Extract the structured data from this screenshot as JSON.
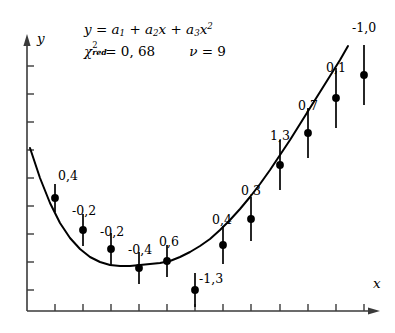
{
  "figure": {
    "title_equation": "y = a1 + a2x + a3x2",
    "axis_x_label": "x",
    "axis_y_label": "y",
    "equation": {
      "lhs": "y",
      "eq_sign": "=",
      "term1_coef": "a",
      "term1_sub": "1",
      "plus1": "+",
      "term2_coef": "a",
      "term2_sub": "2",
      "term2_var": "x",
      "plus2": "+",
      "term3_coef": "a",
      "term3_sub": "3",
      "term3_var": "x",
      "term3_pow": "2"
    },
    "stats": {
      "chi_symbol": "χ",
      "chi_sup": "2",
      "chi_sub": "red",
      "chi_eq": "=",
      "chi_value": "0, 68",
      "nu_symbol": "ν",
      "nu_eq": "=",
      "nu_value": "9"
    },
    "colors": {
      "line": "#000000",
      "marker": "#000000",
      "axis": "#3a3a3a",
      "background": "#ffffff"
    }
  },
  "chart_data": {
    "type": "scatter",
    "xlabel": "x",
    "ylabel": "y",
    "grid": false,
    "legend": null,
    "annotations": [
      "y = a_1 + a_2 x + a_3 x^2",
      "chi^2_red = 0,68",
      "nu = 9"
    ],
    "fit": {
      "model": "quadratic",
      "chi2_red": 0.68,
      "dof": 9,
      "description": "least-squares parabola through data points"
    },
    "point_labels": [
      "0,4",
      "-0,2",
      "-0,2",
      "-0,4",
      "0,6",
      "-1,3",
      "0,4",
      "0,3",
      "1,3",
      "0,7",
      "0,1",
      "-1,0"
    ],
    "points": [
      {
        "label": "0,4",
        "px": 55,
        "py": 198,
        "err_px": 14,
        "label_px": 58,
        "label_py": 170
      },
      {
        "label": "-0,2",
        "px": 83,
        "py": 230,
        "err_px": 16,
        "label_px": 72,
        "label_py": 205
      },
      {
        "label": "-0,2",
        "px": 111,
        "py": 249,
        "err_px": 16,
        "label_px": 100,
        "label_py": 226
      },
      {
        "label": "-0,4",
        "px": 139,
        "py": 268,
        "err_px": 16,
        "label_px": 128,
        "label_py": 244
      },
      {
        "label": "0,6",
        "px": 167,
        "py": 261,
        "err_px": 16,
        "label_px": 159,
        "label_py": 236
      },
      {
        "label": "-1,3",
        "px": 195,
        "py": 290,
        "err_px": 17,
        "label_px": 199,
        "label_py": 273
      },
      {
        "label": "0,4",
        "px": 223,
        "py": 245,
        "err_px": 19,
        "label_px": 212,
        "label_py": 214
      },
      {
        "label": "0,3",
        "px": 251,
        "py": 219,
        "err_px": 22,
        "label_px": 241,
        "label_py": 185
      },
      {
        "label": "1,3",
        "px": 280,
        "py": 165,
        "err_px": 25,
        "label_px": 270,
        "label_py": 130
      },
      {
        "label": "0,7",
        "px": 308,
        "py": 133,
        "err_px": 25,
        "label_px": 298,
        "label_py": 100
      },
      {
        "label": "0,1",
        "px": 336,
        "py": 98,
        "err_px": 30,
        "label_px": 326,
        "label_py": 62
      },
      {
        "label": "-1,0",
        "px": 364,
        "py": 75,
        "err_px": 30,
        "label_px": 352,
        "label_py": 22
      }
    ],
    "axes": {
      "x_axis_y": 311,
      "y_axis_x": 27,
      "x_ticks_px": [
        55,
        83,
        111,
        139,
        167,
        195,
        223,
        251,
        280,
        308,
        336,
        364
      ],
      "y_ticks_px": [
        66,
        94,
        122,
        150,
        178,
        206,
        234,
        262,
        290
      ],
      "x_tick_labels": [],
      "y_tick_labels": []
    },
    "curve_px": [
      [
        30,
        148
      ],
      [
        40,
        178
      ],
      [
        50,
        203
      ],
      [
        60,
        223
      ],
      [
        70,
        238
      ],
      [
        80,
        249
      ],
      [
        90,
        257
      ],
      [
        100,
        262
      ],
      [
        110,
        265
      ],
      [
        120,
        266
      ],
      [
        130,
        266
      ],
      [
        140,
        265
      ],
      [
        150,
        264
      ],
      [
        160,
        263
      ],
      [
        170,
        261
      ],
      [
        180,
        257
      ],
      [
        190,
        252
      ],
      [
        200,
        246
      ],
      [
        210,
        239
      ],
      [
        220,
        230
      ],
      [
        230,
        220
      ],
      [
        240,
        209
      ],
      [
        250,
        197
      ],
      [
        260,
        184
      ],
      [
        270,
        170
      ],
      [
        280,
        155
      ],
      [
        290,
        140
      ],
      [
        300,
        124
      ],
      [
        310,
        108
      ],
      [
        320,
        92
      ],
      [
        330,
        76
      ],
      [
        340,
        60
      ],
      [
        348,
        46
      ]
    ]
  }
}
